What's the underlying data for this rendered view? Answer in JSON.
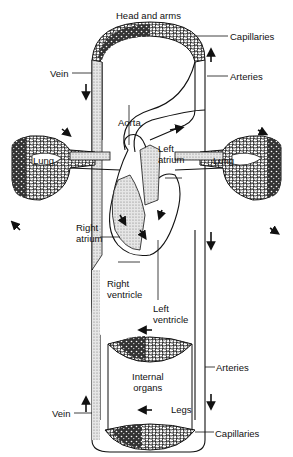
{
  "title": "Head and arms",
  "labels": {
    "head_and_arms": "Head and arms",
    "capillaries_top": "Capillaries",
    "arteries_top": "Arteries",
    "vein_top": "Vein",
    "aorta": "Aorta",
    "lung_left": "Lung",
    "lung_right": "Lung",
    "left_atrium_1": "Left",
    "left_atrium_2": "atrium",
    "right_atrium_1": "Right",
    "right_atrium_2": "atrium",
    "right_ventricle_1": "Right",
    "right_ventricle_2": "ventricle",
    "left_ventricle_1": "Left",
    "left_ventricle_2": "ventricle",
    "internal_organs_1": "Internal",
    "internal_organs_2": "organs",
    "arteries_bottom": "Arteries",
    "legs": "Legs",
    "vein_bottom": "Vein",
    "capillaries_bottom": "Capillaries"
  },
  "colors": {
    "line": "#1a1a1a",
    "venous_stipple": "#c8c8c8",
    "capillary_dark": "#2a2a2a",
    "background": "#ffffff"
  }
}
